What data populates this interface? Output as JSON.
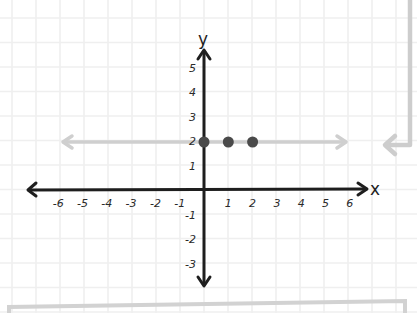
{
  "diagram": {
    "title": "",
    "x_axis": {
      "label": "x",
      "ticks": [
        "-6",
        "-5",
        "-4",
        "-3",
        "-2",
        "-1",
        "1",
        "2",
        "3",
        "4",
        "5",
        "6"
      ],
      "range": [
        -7,
        7
      ]
    },
    "y_axis": {
      "label": "y",
      "ticks_positive": [
        "1",
        "2",
        "3",
        "4",
        "5"
      ],
      "ticks_negative": [
        "-1",
        "-2",
        "-3"
      ],
      "range": [
        -4,
        6
      ]
    },
    "highlighted_line": {
      "equation": "y = 2",
      "color": "#cfcfcf"
    },
    "points": [
      {
        "x": 0,
        "y": 2,
        "label": "(0, 2)"
      },
      {
        "x": 1,
        "y": 2,
        "label": "(1, 2)"
      },
      {
        "x": 2,
        "y": 2,
        "label": "(2, 2)"
      }
    ],
    "colors": {
      "axis": "#1e1e1e",
      "grid": "#efefef",
      "point": "#4a4a4a",
      "guide": "#cccccc"
    }
  },
  "chart_data": {
    "type": "scatter",
    "title": "",
    "xlabel": "x",
    "ylabel": "y",
    "x_ticks": [
      -6,
      -5,
      -4,
      -3,
      -2,
      -1,
      1,
      2,
      3,
      4,
      5,
      6
    ],
    "y_ticks": [
      -3,
      -2,
      -1,
      1,
      2,
      3,
      4,
      5
    ],
    "xlim": [
      -7,
      7
    ],
    "ylim": [
      -4,
      6
    ],
    "grid": true,
    "series": [
      {
        "name": "points",
        "type": "scatter",
        "x": [
          0,
          1,
          2
        ],
        "y": [
          2,
          2,
          2
        ]
      },
      {
        "name": "line y=2",
        "type": "line",
        "x": [
          -6,
          6
        ],
        "y": [
          2,
          2
        ]
      }
    ]
  }
}
